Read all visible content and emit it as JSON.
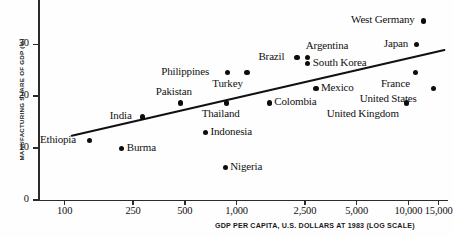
{
  "chart_data": {
    "type": "scatter",
    "title": "",
    "xlabel": "GDP PER CAPITA, U.S. DOLLARS AT 1983 (LOG SCALE)",
    "ylabel": "MANUFACTURING SHARE OF GDP (%)",
    "xscale": "log",
    "yscale": "linear",
    "xlim": [
      70,
      17000
    ],
    "ylim": [
      0,
      37
    ],
    "grid": false,
    "legend": "none",
    "xticks": [
      {
        "value": 100,
        "label": "100"
      },
      {
        "value": 250,
        "label": "250"
      },
      {
        "value": 500,
        "label": "500"
      },
      {
        "value": 1000,
        "label": "1,000"
      },
      {
        "value": 2500,
        "label": "2,500"
      },
      {
        "value": 5000,
        "label": "5,000"
      },
      {
        "value": 10000,
        "label": "10,000"
      },
      {
        "value": 15000,
        "label": "15,000"
      }
    ],
    "yticks": [
      {
        "value": 0,
        "label": "0"
      },
      {
        "value": 10,
        "label": "10"
      },
      {
        "value": 20,
        "label": "20"
      },
      {
        "value": 30,
        "label": "30"
      }
    ],
    "points": [
      {
        "name": "Ethiopia",
        "x": 140,
        "y": 11.5,
        "label_pos": "left"
      },
      {
        "name": "Burma",
        "x": 215,
        "y": 10.0,
        "label_pos": "right"
      },
      {
        "name": "India",
        "x": 285,
        "y": 16.0,
        "label_pos": "left"
      },
      {
        "name": "Pakistan",
        "x": 470,
        "y": 18.7,
        "label_pos": "above-left"
      },
      {
        "name": "Indonesia",
        "x": 660,
        "y": 13.0,
        "label_pos": "right"
      },
      {
        "name": "Nigeria",
        "x": 860,
        "y": 6.2,
        "label_pos": "right"
      },
      {
        "name": "Thailand",
        "x": 870,
        "y": 18.7,
        "label_pos": "below"
      },
      {
        "name": "Philippines",
        "x": 890,
        "y": 24.5,
        "label_pos": "left"
      },
      {
        "name": "Turkey",
        "x": 1150,
        "y": 24.5,
        "label_pos": "below-left"
      },
      {
        "name": "Colombia",
        "x": 1550,
        "y": 18.7,
        "label_pos": "right"
      },
      {
        "name": "Brazil",
        "x": 2250,
        "y": 27.5,
        "label_pos": "left"
      },
      {
        "name": "Argentina",
        "x": 2600,
        "y": 27.5,
        "label_pos": "above-right"
      },
      {
        "name": "South Korea",
        "x": 2600,
        "y": 26.3,
        "label_pos": "right"
      },
      {
        "name": "Mexico",
        "x": 2900,
        "y": 21.5,
        "label_pos": "right"
      },
      {
        "name": "United Kingdom",
        "x": 9700,
        "y": 18.7,
        "label_pos": "below-left"
      },
      {
        "name": "France",
        "x": 11000,
        "y": 24.5,
        "label_pos": "below-left"
      },
      {
        "name": "Japan",
        "x": 11200,
        "y": 30.0,
        "label_pos": "left"
      },
      {
        "name": "West Germany",
        "x": 12200,
        "y": 34.5,
        "label_pos": "left"
      },
      {
        "name": "United States",
        "x": 14000,
        "y": 21.5,
        "label_pos": "below-left"
      }
    ],
    "trendline": {
      "type": "line",
      "x_start": 110,
      "y_start": 12.4,
      "x_end": 16200,
      "y_end": 28.9
    },
    "colors": {
      "point": "#0d0d0d",
      "axis": "#2b2b2b",
      "trendline": "#111111",
      "background": "#fefefe",
      "text": "#111111"
    }
  }
}
